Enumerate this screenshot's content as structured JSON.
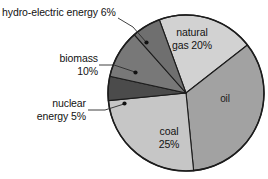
{
  "chart_data": {
    "type": "pie",
    "title": "",
    "xlabel": "",
    "ylabel": "",
    "categories": [
      "natural gas",
      "oil",
      "coal",
      "nuclear energy",
      "biomass",
      "hydro-electric energy"
    ],
    "values": [
      20,
      34,
      25,
      5,
      10,
      6
    ],
    "units": "%",
    "legend_position": "none",
    "grid": false,
    "slices": [
      {
        "id": "natural-gas",
        "name": "natural gas",
        "value": 20,
        "value_label": "20%",
        "label_lines": [
          "natural",
          "gas 20%"
        ],
        "label_placement": "inside",
        "color": "#d2d2d2",
        "start_angle": -20,
        "end_angle": 52
      },
      {
        "id": "oil",
        "name": "oil",
        "value": 34,
        "value_label": "",
        "label_lines": [
          "oil"
        ],
        "label_placement": "inside",
        "color": "#a2a2a2",
        "start_angle": 52,
        "end_angle": 174
      },
      {
        "id": "coal",
        "name": "coal",
        "value": 25,
        "value_label": "25%",
        "label_lines": [
          "coal",
          "25%"
        ],
        "label_placement": "inside",
        "color": "#c6c6c6",
        "start_angle": 174,
        "end_angle": 264
      },
      {
        "id": "nuclear-energy",
        "name": "nuclear energy",
        "value": 5,
        "value_label": "5%",
        "label_lines": [
          "nuclear",
          "energy 5%"
        ],
        "label_placement": "outside",
        "color": "#4b4b4b",
        "start_angle": 264,
        "end_angle": 282
      },
      {
        "id": "biomass",
        "name": "biomass",
        "value": 10,
        "value_label": "10%",
        "label_lines": [
          "biomass",
          "10%"
        ],
        "label_placement": "outside",
        "color": "#787878",
        "start_angle": 282,
        "end_angle": 318
      },
      {
        "id": "hydro-electric-energy",
        "name": "hydro-electric energy",
        "value": 6,
        "value_label": "6%",
        "label_lines": [
          "hydro-electric energy 6%"
        ],
        "label_placement": "outside",
        "color": "#6f6f6f",
        "start_angle": 318,
        "end_angle": 340
      }
    ],
    "callouts": [
      {
        "id": "hydro-electric-callout",
        "text": "hydro-electric energy 6%"
      },
      {
        "id": "biomass-callout",
        "line1": "biomass",
        "line2": "10%"
      },
      {
        "id": "nuclear-callout",
        "line1": "nuclear",
        "line2": "energy 5%"
      }
    ],
    "inner_labels": [
      {
        "id": "natural-gas-label",
        "line1": "natural",
        "line2": "gas 20%"
      },
      {
        "id": "oil-label",
        "line1": "oil"
      },
      {
        "id": "coal-label",
        "line1": "coal",
        "line2": "25%"
      }
    ],
    "colors": {
      "outline": "#1c1c1c",
      "text": "#121212",
      "background": "#ffffff",
      "leader": "#2b2b2b"
    }
  }
}
